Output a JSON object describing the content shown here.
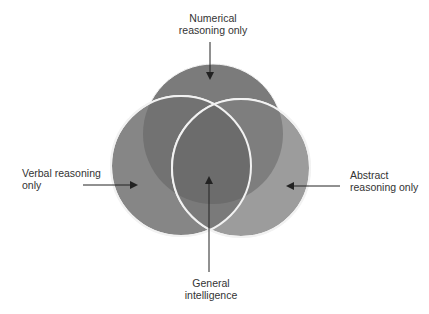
{
  "diagram": {
    "type": "venn",
    "colors": {
      "background": "#ffffff",
      "top_circle": "#7b7b7b",
      "left_circle": "#858585",
      "right_circle": "#9c9c9c",
      "outline": "#f4f4f4",
      "arrow": "#222222",
      "text": "#333333"
    },
    "circles": [
      {
        "id": "numerical",
        "cx": 213,
        "cy": 134,
        "r": 70
      },
      {
        "id": "verbal",
        "cx": 181,
        "cy": 166,
        "r": 70
      },
      {
        "id": "abstract",
        "cx": 241,
        "cy": 168,
        "r": 69
      }
    ],
    "labels": {
      "numerical": {
        "line1": "Numerical",
        "line2": "reasoning only"
      },
      "verbal": {
        "line1": "Verbal reasoning",
        "line2": "only"
      },
      "abstract": {
        "line1": "Abstract",
        "line2": "reasoning only"
      },
      "general": {
        "line1": "General",
        "line2": "intelligence"
      }
    }
  }
}
